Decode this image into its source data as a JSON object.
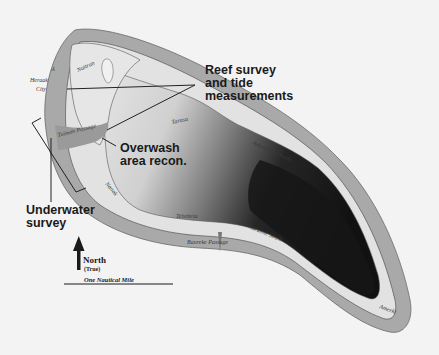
{
  "map": {
    "type": "atoll survey map",
    "colors": {
      "background": "#f3f3f3",
      "reef": "#a9a9a9",
      "reef_outline": "#6a6a6a",
      "land": "#e2e2e2",
      "lagoon_light": "#d4d4d4",
      "lagoon_dark": "#1a1a1a",
      "line": "#222222"
    },
    "places": {
      "nuitran": "Nuitran",
      "heraak_city_line1": "Heraak",
      "heraak_city_line2": "City",
      "tuiman_passage": "Tuiman Passage",
      "tarasa": "Tarasa",
      "ankaraime_north": "Ankaraime North",
      "ankaraime_south": "Ankaraime South",
      "nanok": "Nanok",
      "tehebeia": "Tehebeia",
      "baureke_passage": "Baureke Passage",
      "amerki": "Amerki"
    },
    "callouts": {
      "reef_survey_line1": "Reef survey",
      "reef_survey_line2": "and tide",
      "reef_survey_line3": "measurements",
      "overwash_line1": "Overwash",
      "overwash_line2": "area recon.",
      "underwater_line1": "Underwater",
      "underwater_line2": "survey"
    },
    "legend": {
      "north_label": "North",
      "north_sub": "(True)",
      "scale_label": "One Nautical Mile"
    }
  }
}
